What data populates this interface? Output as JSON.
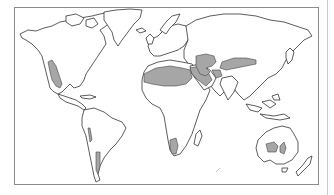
{
  "map": {
    "type": "world-outline",
    "projection": "equirectangular-like",
    "highlight_color": "#a6a6a6",
    "outline_color": "#333333",
    "frame_color": "#8a8a8a",
    "highlighted_regions": [
      "Southwestern North America (Great Basin / Mojave / Sonoran / Chihuahuan)",
      "Sahara",
      "Arabian Desert",
      "Central Asian deserts (Karakum / Kyzylkum)",
      "Gobi / Taklamakan",
      "Thar / Iranian deserts",
      "Kalahari / Namib",
      "Patagonian Desert",
      "Atacama (coastal strip)",
      "Australian deserts (Great Victoria / Simpson)"
    ]
  }
}
